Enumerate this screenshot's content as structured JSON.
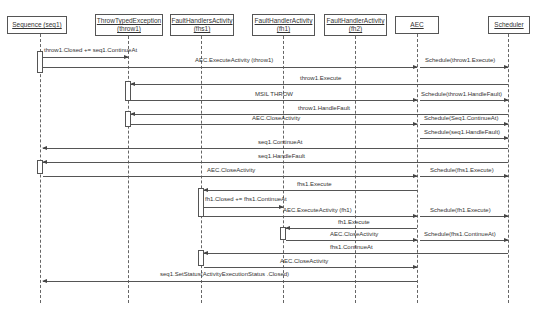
{
  "actors": [
    {
      "id": "seq1",
      "label_line1": "Sequence (seq1)",
      "label_line2": "",
      "x": 40,
      "box_left": 7,
      "box_width": 60
    },
    {
      "id": "throw1",
      "label_line1": "ThrowTypedException",
      "label_line2": "(throw1)",
      "x": 128,
      "box_left": 95,
      "box_width": 68
    },
    {
      "id": "fhs1",
      "label_line1": "FaultHandlersActivity",
      "label_line2": "(fhs1)",
      "x": 201,
      "box_left": 170,
      "box_width": 64
    },
    {
      "id": "fh1",
      "label_line1": "FaultHandlerActivity",
      "label_line2": "(fh1)",
      "x": 283,
      "box_left": 252,
      "box_width": 63
    },
    {
      "id": "fh2",
      "label_line1": "FaultHandlerActivity",
      "label_line2": "(fh2)",
      "x": 355,
      "box_left": 324,
      "box_width": 63
    },
    {
      "id": "AEC",
      "label_line1": "AEC",
      "label_line2": "",
      "x": 417,
      "box_left": 395,
      "box_width": 44
    },
    {
      "id": "Scheduler",
      "label_line1": "Scheduler",
      "label_line2": "",
      "x": 508,
      "box_left": 488,
      "box_width": 42
    }
  ],
  "messages": [
    {
      "label": "throw1.Closed += seq1.ContinueAt",
      "from": "seq1",
      "to": "throw1",
      "y": 57,
      "label_x": 44,
      "label_y": 47,
      "dir": "right"
    },
    {
      "label": "AEC.ExecuteActivity  (throw1)",
      "from": "seq1",
      "to": "AEC",
      "y": 67,
      "label_x": 195,
      "label_y": 57,
      "dir": "right"
    },
    {
      "label": "Schedule(throw1.Execute)",
      "from": "AEC",
      "to": "Scheduler",
      "y": 67,
      "label_x": 425,
      "label_y": 57,
      "dir": "right"
    },
    {
      "label": "throw1.Execute",
      "from": "Scheduler",
      "to": "throw1",
      "y": 84,
      "label_x": 300,
      "label_y": 75,
      "dir": "left"
    },
    {
      "label": "MSIL THROW",
      "from": "throw1",
      "to": "AEC",
      "y": 100,
      "label_x": 255,
      "label_y": 91,
      "dir": "right"
    },
    {
      "label": "Schedule(throw1.HandleFault)",
      "from": "AEC",
      "to": "Scheduler",
      "y": 100,
      "label_x": 421,
      "label_y": 91,
      "dir": "right"
    },
    {
      "label": "throw1.HandleFault",
      "from": "Scheduler",
      "to": "throw1",
      "y": 114,
      "label_x": 298,
      "label_y": 105,
      "dir": "left"
    },
    {
      "label": "AEC.CloseActivity",
      "from": "throw1",
      "to": "AEC",
      "y": 124,
      "label_x": 252,
      "label_y": 115,
      "dir": "right"
    },
    {
      "label": "Schedule(Seq1.ContinueAt)",
      "from": "AEC",
      "to": "Scheduler",
      "y": 124,
      "label_x": 424,
      "label_y": 115,
      "dir": "right"
    },
    {
      "label": "Schedule(seq1.HandleFault)",
      "from": "AEC",
      "to": "Scheduler",
      "y": 138,
      "label_x": 424,
      "label_y": 129,
      "dir": "right"
    },
    {
      "label": "seq1.ContinueAt",
      "from": "Scheduler",
      "to": "seq1",
      "y": 148,
      "label_x": 258,
      "label_y": 139,
      "dir": "left"
    },
    {
      "label": "seq1.HandleFault",
      "from": "Scheduler",
      "to": "seq1",
      "y": 162,
      "label_x": 258,
      "label_y": 153,
      "dir": "left"
    },
    {
      "label": "AEC.CloseActivity",
      "from": "seq1",
      "to": "AEC",
      "y": 176,
      "label_x": 207,
      "label_y": 167,
      "dir": "right"
    },
    {
      "label": "Schedule(fhs1.Execute)",
      "from": "AEC",
      "to": "Scheduler",
      "y": 176,
      "label_x": 430,
      "label_y": 167,
      "dir": "right"
    },
    {
      "label": "fhs1.Execute",
      "from": "AEC",
      "to": "fhs1",
      "y": 190,
      "label_x": 297,
      "label_y": 181,
      "dir": "left"
    },
    {
      "label": "fh1.Closed += fhs1.ContinueAt",
      "from": "fhs1",
      "to": "fh1",
      "y": 207,
      "label_x": 205,
      "label_y": 196,
      "dir": "right"
    },
    {
      "label": "AEC.ExecuteActivity  (fh1)",
      "from": "fhs1",
      "to": "AEC",
      "y": 216,
      "label_x": 283,
      "label_y": 207,
      "dir": "right"
    },
    {
      "label": "Schedule(fh1.Execute)",
      "from": "AEC",
      "to": "Scheduler",
      "y": 216,
      "label_x": 430,
      "label_y": 207,
      "dir": "right"
    },
    {
      "label": "fh1.Execute",
      "from": "AEC",
      "to": "fh1",
      "y": 228,
      "label_x": 338,
      "label_y": 219,
      "dir": "left"
    },
    {
      "label": "AEC.CloseActivity",
      "from": "fh1",
      "to": "AEC",
      "y": 240,
      "label_x": 330,
      "label_y": 231,
      "dir": "right"
    },
    {
      "label": "Schedule(fhs1.ContinueAt)",
      "from": "AEC",
      "to": "Scheduler",
      "y": 240,
      "label_x": 424,
      "label_y": 231,
      "dir": "right"
    },
    {
      "label": "fhs1.ContinueAt",
      "from": "Scheduler",
      "to": "fhs1",
      "y": 253,
      "label_x": 330,
      "label_y": 244,
      "dir": "left"
    },
    {
      "label": "AEC.CloseActivity",
      "from": "fhs1",
      "to": "AEC",
      "y": 267,
      "label_x": 280,
      "label_y": 258,
      "dir": "right"
    },
    {
      "label": "seq1.SetStatus(ActivityExecutionStatus .Closed)",
      "from": "AEC",
      "to": "seq1",
      "y": 281,
      "label_x": 160,
      "label_y": 271,
      "dir": "left"
    }
  ],
  "activations": [
    {
      "actor": "seq1",
      "top": 51,
      "height": 22
    },
    {
      "actor": "throw1",
      "top": 81,
      "height": 20
    },
    {
      "actor": "throw1",
      "top": 111,
      "height": 16
    },
    {
      "actor": "seq1",
      "top": 160,
      "height": 14
    },
    {
      "actor": "fhs1",
      "top": 188,
      "height": 29
    },
    {
      "actor": "fh1",
      "top": 227,
      "height": 13
    },
    {
      "actor": "fhs1",
      "top": 250,
      "height": 16
    }
  ],
  "lifeline_bottom": 303
}
